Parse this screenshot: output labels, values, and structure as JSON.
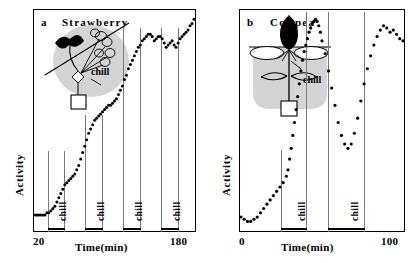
{
  "figure": {
    "panels": [
      {
        "tag": "a",
        "species": "Strawberry",
        "y_axis_label": "Activity",
        "x_axis_title": "Time(min)",
        "x_min_label": "20",
        "x_max_label": "180",
        "chill_label": "chill",
        "illustration_note": "chill",
        "chill_count": 4
      },
      {
        "tag": "b",
        "species": "Cowpea",
        "y_axis_label": "Activity",
        "x_axis_title": "Time(min)",
        "x_min_label": "0",
        "x_max_label": "100",
        "chill_label": "chill",
        "illustration_note": "chill",
        "chill_count": 2
      }
    ]
  },
  "chart_data": [
    {
      "type": "scatter",
      "title": "a  Strawberry",
      "xlabel": "Time(min)",
      "ylabel": "Activity",
      "xlim": [
        20,
        180
      ],
      "ylim": [
        0,
        100
      ],
      "grid": false,
      "legend": null,
      "marker": "filled-circle",
      "series": [
        {
          "name": "Activity",
          "x": [
            20,
            22,
            24,
            26,
            28,
            30,
            32,
            34,
            36,
            38,
            40,
            42,
            44,
            46,
            48,
            50,
            52,
            54,
            56,
            58,
            60,
            62,
            64,
            66,
            68,
            70,
            72,
            74,
            76,
            78,
            80,
            82,
            84,
            86,
            88,
            90,
            92,
            94,
            96,
            98,
            100,
            102,
            104,
            106,
            108,
            110,
            112,
            114,
            116,
            118,
            120,
            122,
            124,
            126,
            128,
            130,
            132,
            134,
            136,
            138,
            140,
            142,
            144,
            146,
            148,
            150,
            152,
            154,
            156,
            158,
            160,
            162,
            164,
            166,
            168,
            170,
            172,
            174,
            176,
            178,
            180
          ],
          "y": [
            7,
            7,
            7,
            7,
            7,
            7,
            8,
            8,
            9,
            10,
            11,
            13,
            15,
            17,
            19,
            21,
            22,
            23,
            24,
            25,
            26,
            28,
            30,
            33,
            36,
            39,
            42,
            45,
            47,
            49,
            51,
            52,
            53,
            54,
            55,
            56,
            57,
            58,
            58,
            59,
            60,
            61,
            63,
            65,
            67,
            70,
            72,
            75,
            77,
            79,
            81,
            83,
            85,
            86,
            88,
            89,
            90,
            91,
            91,
            90,
            88,
            89,
            90,
            90,
            89,
            87,
            85,
            86,
            87,
            88,
            86,
            85,
            87,
            89,
            90,
            91,
            92,
            93,
            95,
            96,
            98
          ]
        }
      ],
      "annotations": [
        {
          "label": "chill",
          "x_start": 31,
          "x_end": 46,
          "type": "interval-bar"
        },
        {
          "label": "chill",
          "x_start": 68,
          "x_end": 84,
          "type": "interval-bar"
        },
        {
          "label": "chill",
          "x_start": 105,
          "x_end": 121,
          "type": "interval-bar"
        },
        {
          "label": "chill",
          "x_start": 143,
          "x_end": 160,
          "type": "interval-bar"
        }
      ]
    },
    {
      "type": "scatter",
      "title": "b  Cowpea",
      "xlabel": "Time(min)",
      "ylabel": "Activity",
      "xlim": [
        0,
        100
      ],
      "ylim": [
        0,
        100
      ],
      "grid": false,
      "legend": null,
      "marker": "filled-circle",
      "series": [
        {
          "name": "Activity",
          "x": [
            0,
            2,
            4,
            6,
            8,
            10,
            12,
            14,
            16,
            18,
            20,
            22,
            24,
            26,
            28,
            29,
            30,
            31,
            32,
            33,
            34,
            35,
            36,
            37,
            38,
            39,
            40,
            41,
            42,
            43,
            44,
            45,
            46,
            47,
            48,
            49,
            50,
            52,
            54,
            56,
            58,
            60,
            62,
            64,
            66,
            68,
            70,
            72,
            74,
            76,
            78,
            80,
            82,
            84,
            86,
            88,
            90,
            92,
            94,
            96,
            98,
            100
          ],
          "y": [
            6,
            5,
            4,
            4,
            5,
            6,
            8,
            10,
            12,
            14,
            16,
            18,
            20,
            22,
            25,
            28,
            33,
            38,
            44,
            50,
            56,
            62,
            68,
            74,
            79,
            83,
            86,
            89,
            92,
            94,
            96,
            97,
            98,
            97,
            95,
            92,
            88,
            82,
            74,
            66,
            58,
            50,
            44,
            40,
            38,
            40,
            45,
            52,
            60,
            68,
            75,
            81,
            86,
            90,
            93,
            95,
            94,
            92,
            93,
            91,
            89,
            88
          ]
        }
      ],
      "annotations": [
        {
          "label": "chill",
          "x_start": 27,
          "x_end": 42,
          "type": "interval-bar"
        },
        {
          "label": "chill",
          "x_start": 55,
          "x_end": 77,
          "type": "interval-bar"
        }
      ]
    }
  ]
}
